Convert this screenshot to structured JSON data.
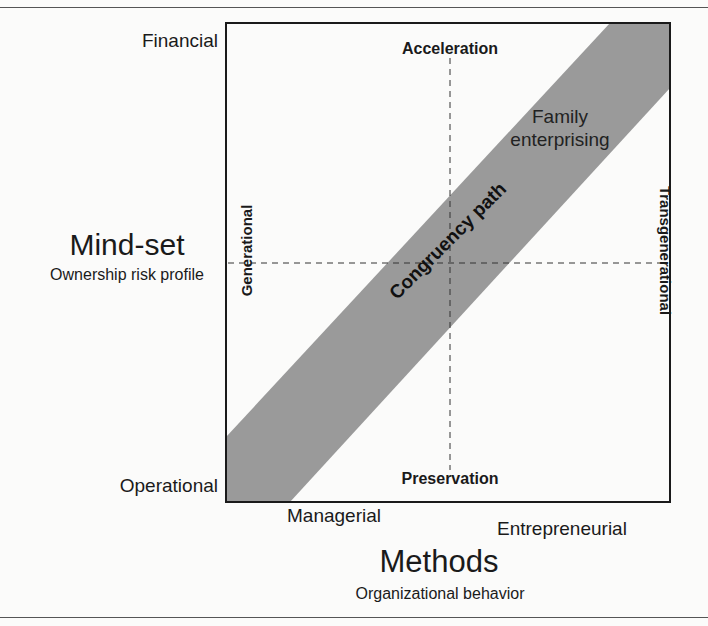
{
  "diagram": {
    "type": "quadrant-diagram",
    "y_axis": {
      "title": "Mind-set",
      "subtitle": "Ownership risk profile",
      "top_label": "Financial",
      "bottom_label": "Operational"
    },
    "x_axis": {
      "title": "Methods",
      "subtitle": "Organizational behavior",
      "left_label": "Managerial",
      "right_label": "Entrepreneurial"
    },
    "inner_labels": {
      "top": "Acceleration",
      "bottom": "Preservation",
      "left": "Generational",
      "right": "Transgenerational"
    },
    "band": {
      "label": "Congruency path",
      "end_label_line1": "Family",
      "end_label_line2": "enterprising",
      "color": "#9a9a9a"
    },
    "colors": {
      "frame": "#1a1a1a",
      "dash": "#333333",
      "background": "#fbfbfa"
    }
  }
}
